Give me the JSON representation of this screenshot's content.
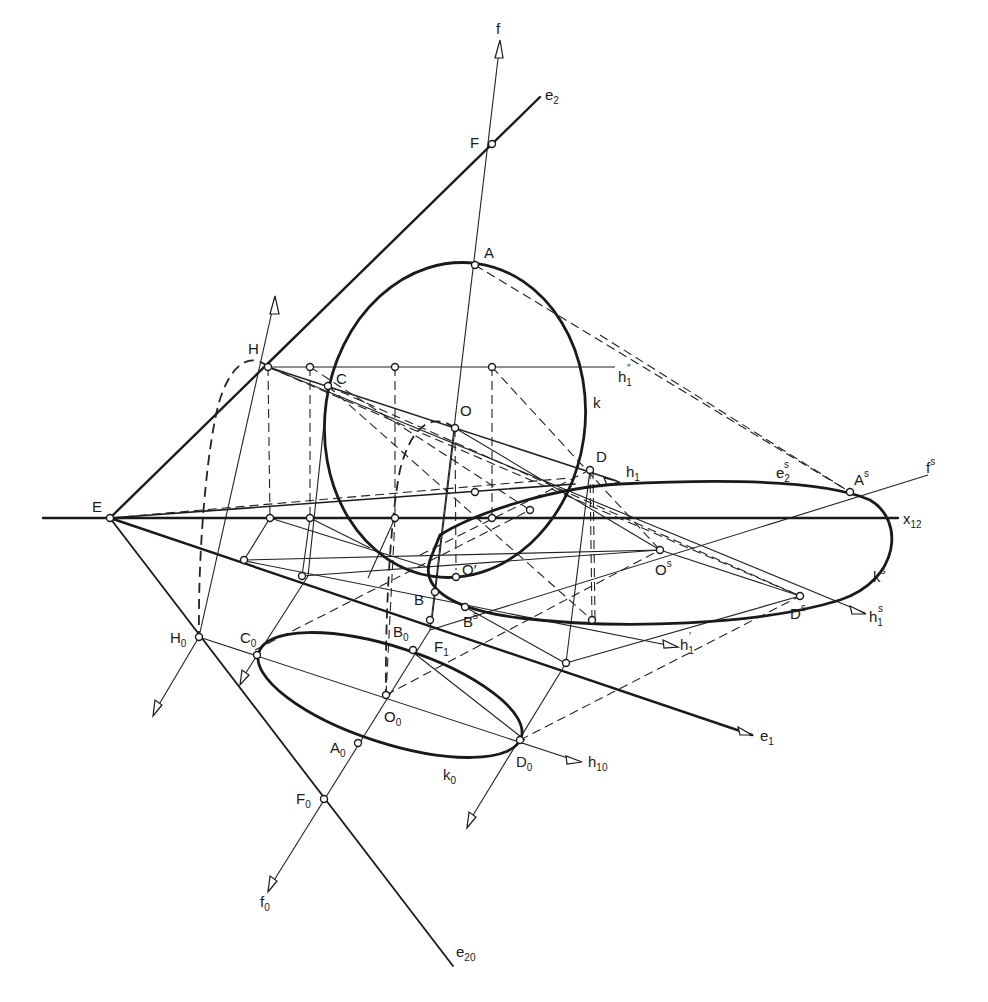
{
  "figure": {
    "type": "descriptive-geometry construction"
  },
  "labels": {
    "f": {
      "main": "f",
      "sup": ""
    },
    "e2": {
      "main": "e",
      "sub": "2"
    },
    "F": {
      "main": "F"
    },
    "A": {
      "main": "A"
    },
    "H": {
      "main": "H"
    },
    "C": {
      "main": "C"
    },
    "h1pp": {
      "main": "h",
      "sub": "1",
      "sup": "″"
    },
    "k": {
      "main": "k"
    },
    "O": {
      "main": "O"
    },
    "D": {
      "main": "D"
    },
    "h1": {
      "main": "h",
      "sub": "1"
    },
    "e2s": {
      "main": "e",
      "sub": "2",
      "sup": "s"
    },
    "As": {
      "main": "A",
      "sup": "s"
    },
    "fs": {
      "main": "f",
      "sup": "s"
    },
    "E": {
      "main": "E"
    },
    "x12": {
      "main": "x",
      "sub": "12"
    },
    "Os": {
      "main": "O",
      "sup": "s"
    },
    "ks": {
      "main": "k",
      "sup": "s"
    },
    "Oprime": {
      "main": "O′"
    },
    "B": {
      "main": "B"
    },
    "Bs": {
      "main": "B",
      "sup": "s"
    },
    "Ds": {
      "main": "D",
      "sup": "s"
    },
    "h1s": {
      "main": "h",
      "sub": "1",
      "sup": "s"
    },
    "H0": {
      "main": "H",
      "sub": "0"
    },
    "C0": {
      "main": "C",
      "sub": "0"
    },
    "B0": {
      "main": "B",
      "sub": "0"
    },
    "F1": {
      "main": "F",
      "sub": "1"
    },
    "h1prime": {
      "main": "h",
      "sub": "1",
      "sup": "′"
    },
    "O0": {
      "main": "O",
      "sub": "0"
    },
    "e1": {
      "main": "e",
      "sub": "1"
    },
    "A0": {
      "main": "A",
      "sub": "0"
    },
    "D0": {
      "main": "D",
      "sub": "0"
    },
    "h10": {
      "main": "h",
      "sub": "10"
    },
    "k0": {
      "main": "k",
      "sub": "0"
    },
    "F0": {
      "main": "F",
      "sub": "0"
    },
    "f0": {
      "main": "f",
      "sub": "0"
    },
    "e20": {
      "main": "e",
      "sub": "20"
    }
  },
  "colors": {
    "ink": "#1a1a1a",
    "paper": "#ffffff"
  }
}
